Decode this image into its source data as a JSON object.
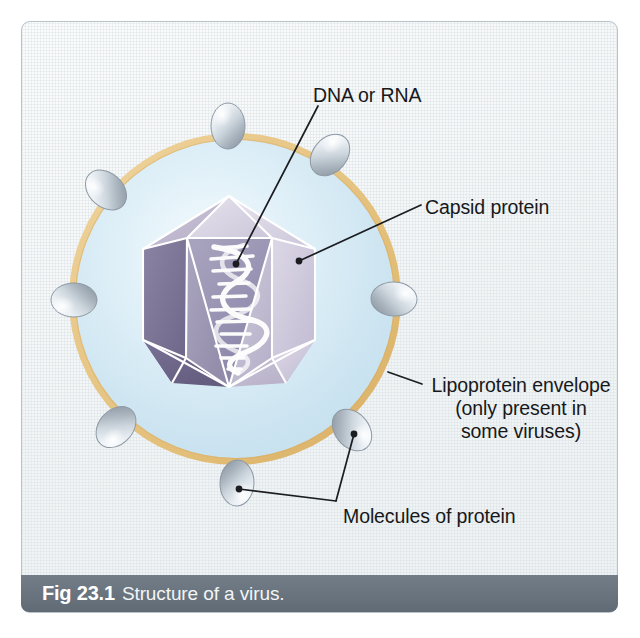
{
  "figure": {
    "caption_number": "Fig 23.1",
    "caption_text": "Structure of a virus."
  },
  "labels": {
    "dna": "DNA or RNA",
    "capsid": "Capsid protein",
    "envelope_line1": "Lipoprotein envelope",
    "envelope_line2": "(only present in",
    "envelope_line3": "some viruses)",
    "molecules": "Molecules of protein"
  },
  "colors": {
    "envelope_ring": "#e9c98b",
    "envelope_ring_shadow": "#c9a45f",
    "interior_blue": "#cfe6f2",
    "interior_blue_center": "#eaf5fa",
    "capsid_dark": "#736b90",
    "capsid_mid": "#8d86a6",
    "capsid_light": "#c9c3d8",
    "capsid_pale": "#e2dee9",
    "capsid_edge": "#ffffff",
    "protein_molecule": "#dfe5ea",
    "protein_molecule_shade": "#9aa4ae",
    "dna_helix": "#ffffff",
    "caption_bar": "#68737d",
    "caption_text": "#ffffff",
    "label_text": "#17181a",
    "leader_line": "#1b1d20",
    "card_background": "#f2f5f6",
    "card_border": "#b9c2c7"
  },
  "geometry": {
    "envelope_center_x": 235,
    "envelope_center_y": 299,
    "envelope_radius": 164,
    "protein_molecule_count": 10,
    "capsid_shape": "icosahedron",
    "nucleic_acid_shape": "double-helix"
  }
}
